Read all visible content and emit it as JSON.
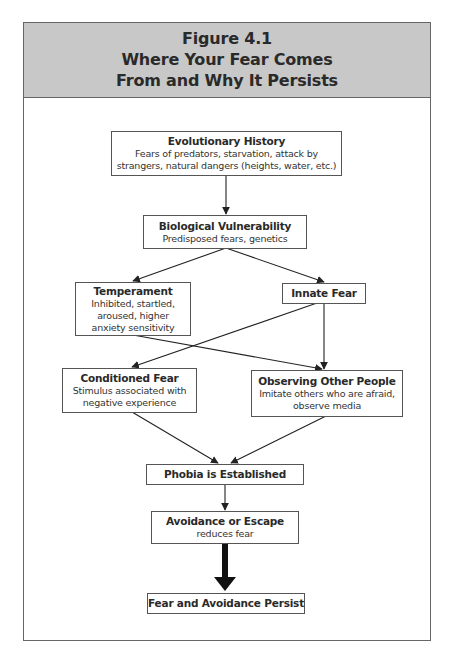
{
  "figure": {
    "number": "Figure 4.1",
    "title_line1": "Where Your Fear Comes",
    "title_line2": "From and Why It Persists"
  },
  "nodes": {
    "evolutionary_history": {
      "title": "Evolutionary History",
      "desc_line1": "Fears of predators, starvation, attack by",
      "desc_line2": "strangers, natural dangers (heights, water, etc.)"
    },
    "biological_vulnerability": {
      "title": "Biological Vulnerability",
      "desc_line1": "Predisposed fears, genetics"
    },
    "temperament": {
      "title": "Temperament",
      "desc_line1": "Inhibited, startled,",
      "desc_line2": "aroused, higher",
      "desc_line3": "anxiety sensitivity"
    },
    "innate_fear": {
      "title": "Innate Fear"
    },
    "conditioned_fear": {
      "title": "Conditioned Fear",
      "desc_line1": "Stimulus associated with",
      "desc_line2": "negative experience"
    },
    "observing_others": {
      "title": "Observing Other People",
      "desc_line1": "Imitate others who are afraid,",
      "desc_line2": "observe media"
    },
    "phobia_established": {
      "title": "Phobia is Established"
    },
    "avoidance_escape": {
      "title": "Avoidance or Escape",
      "desc_line1": "reduces fear"
    },
    "fear_persist": {
      "title": "Fear and Avoidance Persist"
    }
  },
  "edges": [
    {
      "from": "Evolutionary History",
      "to": "Biological Vulnerability"
    },
    {
      "from": "Biological Vulnerability",
      "to": "Temperament"
    },
    {
      "from": "Biological Vulnerability",
      "to": "Innate Fear"
    },
    {
      "from": "Temperament",
      "to": "Observing Other People"
    },
    {
      "from": "Innate Fear",
      "to": "Conditioned Fear"
    },
    {
      "from": "Innate Fear",
      "to": "Observing Other People"
    },
    {
      "from": "Conditioned Fear",
      "to": "Phobia is Established"
    },
    {
      "from": "Observing Other People",
      "to": "Phobia is Established"
    },
    {
      "from": "Phobia is Established",
      "to": "Avoidance or Escape"
    },
    {
      "from": "Avoidance or Escape",
      "to": "Fear and Avoidance Persist",
      "style": "thick"
    }
  ],
  "colors": {
    "header_bg": "#c8c8c8",
    "border": "#555555",
    "arrow": "#222222"
  }
}
